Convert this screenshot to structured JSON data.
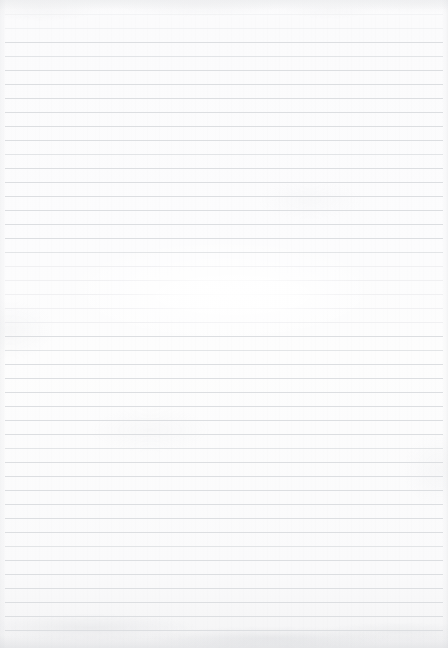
{
  "document": {
    "kind": "ruled-notebook-paper",
    "title": "Blank Ruled Paper",
    "content_text": "",
    "page_width": 448,
    "page_height": 648,
    "has_visible_text": false,
    "has_handwriting": false,
    "has_margin_rule": false,
    "has_holes": false
  },
  "colors": {
    "paper": "#fcfcfd",
    "paper_shadow": "#f4f4f5",
    "rule_line": "#dcdee1",
    "rule_line_faint": "#e8e9eb",
    "texture_mottle": "#cdcfd2"
  },
  "ruling": {
    "line_count": 45,
    "first_line_y": 14,
    "line_spacing": 14,
    "line_thickness": 1,
    "line_start_x": 5,
    "line_end_x": 443,
    "orientation": "horizontal",
    "style": "wide-ruled-faint"
  },
  "regions": {
    "top_margin_height": 14,
    "bottom_margin_height": 9,
    "left_margin_width": 5,
    "right_margin_width": 5,
    "center_highlight": {
      "x": 88,
      "y": 258,
      "width": 290,
      "height": 74,
      "description": "soft light wash fading the rules near page center"
    }
  }
}
